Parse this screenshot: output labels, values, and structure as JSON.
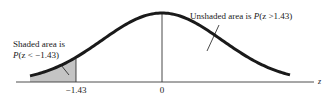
{
  "diagram": {
    "type": "standard-normal-curve",
    "axis_label": "z",
    "ticks": [
      {
        "value": -1.43,
        "label": "−1.43"
      },
      {
        "value": 0,
        "label": "0"
      }
    ],
    "shaded_annotation": {
      "line1": "Shaded area is",
      "line2_prefix": "P",
      "line2_expr": "(z < −1.43)"
    },
    "unshaded_annotation": {
      "prefix": "Unshaded area is ",
      "p": "P",
      "expr": "(z >1.43)"
    },
    "colors": {
      "curve": "#1a1a1a",
      "shade": "#c4c4c4",
      "axis": "#3a3a3a"
    }
  }
}
